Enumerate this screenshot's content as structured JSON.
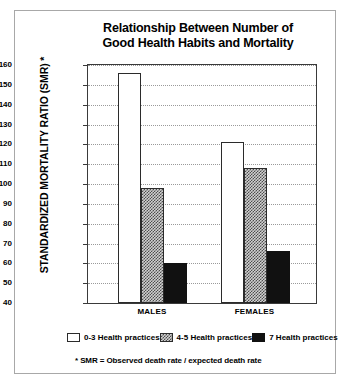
{
  "chart_data": {
    "type": "bar",
    "title": "Relationship Between Number of Good Health Habits and Mortality",
    "title_line1": "Relationship Between Number of",
    "title_line2": "Good Health Habits and Mortality",
    "xlabel": "",
    "ylabel": "STANDARDIZED MORTALITY RATIO (SMR) *",
    "categories": [
      "MALES",
      "FEMALES"
    ],
    "ylim": [
      40,
      160
    ],
    "ytick_labels": [
      "160",
      "150",
      "140",
      "130",
      "120",
      "110",
      "100",
      "90",
      "80",
      "70",
      "60",
      "50",
      "40"
    ],
    "yticks": [
      160,
      150,
      140,
      130,
      120,
      110,
      100,
      90,
      80,
      70,
      60,
      50,
      40
    ],
    "grid": true,
    "legend_position": "bottom",
    "series": [
      {
        "name": "0-3 Health practices",
        "values": [
          156,
          121
        ],
        "color": "#ffffff",
        "swatch": "white"
      },
      {
        "name": "4-5 Health practices",
        "values": [
          98,
          108
        ],
        "color": "#d0d0d0",
        "swatch": "gray"
      },
      {
        "name": "7 Health practices",
        "values": [
          60,
          66
        ],
        "color": "#111111",
        "swatch": "black"
      }
    ],
    "footnote": "*  SMR = Observed death rate / expected death rate",
    "ylabel_footnote_marker": "*"
  }
}
